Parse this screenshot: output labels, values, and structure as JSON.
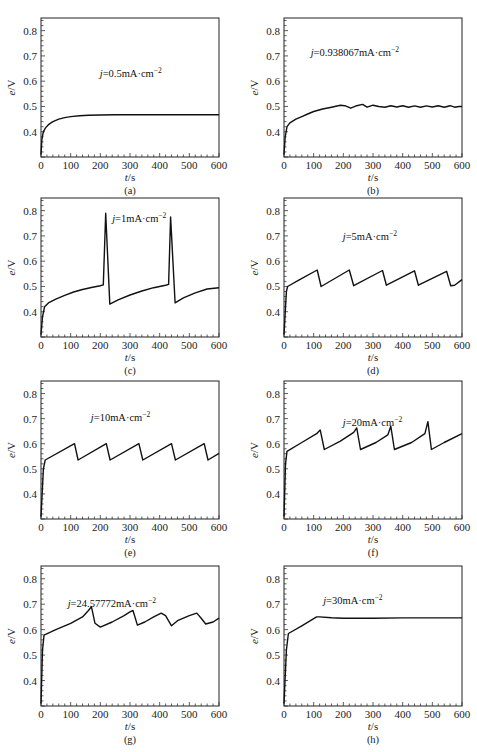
{
  "figure": {
    "panels": [
      {
        "id": "a",
        "caption": "(a)",
        "annotation_prefix": "j",
        "annotation_text": "=0.5mA·cm",
        "annotation_sup": "−2",
        "ann_pos": [
          0.33,
          0.35
        ]
      },
      {
        "id": "b",
        "caption": "(b)",
        "annotation_prefix": "j",
        "annotation_text": "=0.938067mA·cm",
        "annotation_sup": "−2",
        "ann_pos": [
          0.15,
          0.2
        ]
      },
      {
        "id": "c",
        "caption": "(c)",
        "annotation_prefix": "j",
        "annotation_text": "=1mA·cm",
        "annotation_sup": "−2",
        "ann_pos": [
          0.4,
          0.1
        ]
      },
      {
        "id": "d",
        "caption": "(d)",
        "annotation_prefix": "j",
        "annotation_text": "=5mA·cm",
        "annotation_sup": "−2",
        "ann_pos": [
          0.33,
          0.23
        ]
      },
      {
        "id": "e",
        "caption": "(e)",
        "annotation_prefix": "j",
        "annotation_text": "=10mA·cm",
        "annotation_sup": "−2",
        "ann_pos": [
          0.28,
          0.22
        ]
      },
      {
        "id": "f",
        "caption": "(f)",
        "annotation_prefix": "j",
        "annotation_text": "=20mA·cm",
        "annotation_sup": "−2",
        "ann_pos": [
          0.33,
          0.25
        ]
      },
      {
        "id": "g",
        "caption": "(g)",
        "annotation_prefix": "j",
        "annotation_text": "=24.57772mA·cm",
        "annotation_sup": "−2",
        "ann_pos": [
          0.15,
          0.22
        ]
      },
      {
        "id": "h",
        "caption": "(h)",
        "annotation_prefix": "j",
        "annotation_text": "=30mA·cm",
        "annotation_sup": "−2",
        "ann_pos": [
          0.22,
          0.2
        ]
      }
    ],
    "xlabel_italic": "t",
    "xlabel_unit": "/s",
    "ylabel_italic": "e",
    "ylabel_unit": "/V"
  },
  "chart_data": [
    {
      "type": "line",
      "panel": "a",
      "title": "j=0.5mA·cm−2",
      "xlabel": "t/s",
      "ylabel": "e/V",
      "xlim": [
        0,
        600
      ],
      "ylim": [
        0.3,
        0.85
      ],
      "xticks": [
        0,
        100,
        200,
        300,
        400,
        500,
        600
      ],
      "yticks": [
        0.4,
        0.5,
        0.6,
        0.7,
        0.8
      ],
      "x": [
        0,
        3,
        8,
        15,
        25,
        40,
        60,
        80,
        100,
        130,
        160,
        200,
        250,
        300,
        400,
        500,
        600
      ],
      "y": [
        0.31,
        0.37,
        0.4,
        0.415,
        0.428,
        0.44,
        0.45,
        0.456,
        0.46,
        0.463,
        0.465,
        0.466,
        0.467,
        0.467,
        0.467,
        0.467,
        0.467
      ]
    },
    {
      "type": "line",
      "panel": "b",
      "title": "j=0.938067mA·cm−2",
      "xlabel": "t/s",
      "ylabel": "e/V",
      "xlim": [
        0,
        600
      ],
      "ylim": [
        0.3,
        0.85
      ],
      "xticks": [
        0,
        100,
        200,
        300,
        400,
        500,
        600
      ],
      "yticks": [
        0.4,
        0.5,
        0.6,
        0.7,
        0.8
      ],
      "x": [
        0,
        4,
        10,
        20,
        40,
        60,
        80,
        100,
        130,
        160,
        190,
        205,
        225,
        245,
        265,
        280,
        300,
        320,
        340,
        360,
        380,
        400,
        420,
        440,
        460,
        480,
        500,
        520,
        540,
        560,
        575,
        590,
        600
      ],
      "y": [
        0.31,
        0.38,
        0.42,
        0.435,
        0.45,
        0.46,
        0.47,
        0.48,
        0.49,
        0.497,
        0.505,
        0.503,
        0.493,
        0.503,
        0.508,
        0.497,
        0.505,
        0.5,
        0.497,
        0.503,
        0.498,
        0.503,
        0.497,
        0.502,
        0.497,
        0.502,
        0.498,
        0.503,
        0.497,
        0.503,
        0.497,
        0.5,
        0.5
      ]
    },
    {
      "type": "line",
      "panel": "c",
      "title": "j=1mA·cm−2",
      "xlabel": "t/s",
      "ylabel": "e/V",
      "xlim": [
        0,
        600
      ],
      "ylim": [
        0.3,
        0.85
      ],
      "xticks": [
        0,
        100,
        200,
        300,
        400,
        500,
        600
      ],
      "yticks": [
        0.4,
        0.5,
        0.6,
        0.7,
        0.8
      ],
      "x": [
        0,
        5,
        12,
        25,
        50,
        80,
        110,
        140,
        170,
        200,
        210,
        218,
        232,
        260,
        300,
        340,
        380,
        420,
        430,
        437,
        452,
        480,
        520,
        560,
        600
      ],
      "y": [
        0.31,
        0.38,
        0.42,
        0.435,
        0.45,
        0.465,
        0.478,
        0.488,
        0.496,
        0.503,
        0.506,
        0.79,
        0.43,
        0.447,
        0.466,
        0.482,
        0.495,
        0.505,
        0.508,
        0.775,
        0.435,
        0.455,
        0.475,
        0.49,
        0.495
      ]
    },
    {
      "type": "line",
      "panel": "d",
      "title": "j=5mA·cm−2",
      "xlabel": "t/s",
      "ylabel": "e/V",
      "xlim": [
        0,
        600
      ],
      "ylim": [
        0.3,
        0.85
      ],
      "xticks": [
        0,
        100,
        200,
        300,
        400,
        500,
        600
      ],
      "yticks": [
        0.4,
        0.5,
        0.6,
        0.7,
        0.8
      ],
      "x": [
        0,
        8,
        12,
        50,
        112,
        125,
        220,
        235,
        332,
        345,
        440,
        453,
        548,
        562,
        575,
        600
      ],
      "y": [
        0.31,
        0.48,
        0.5,
        0.525,
        0.565,
        0.5,
        0.565,
        0.503,
        0.563,
        0.505,
        0.562,
        0.505,
        0.56,
        0.503,
        0.505,
        0.527
      ]
    },
    {
      "type": "line",
      "panel": "e",
      "title": "j=10mA·cm−2",
      "xlabel": "t/s",
      "ylabel": "e/V",
      "xlim": [
        0,
        600
      ],
      "ylim": [
        0.3,
        0.85
      ],
      "xticks": [
        0,
        100,
        200,
        300,
        400,
        500,
        600
      ],
      "yticks": [
        0.4,
        0.5,
        0.6,
        0.7,
        0.8
      ],
      "x": [
        0,
        8,
        14,
        113,
        125,
        220,
        233,
        330,
        343,
        440,
        453,
        550,
        563,
        600
      ],
      "y": [
        0.31,
        0.5,
        0.535,
        0.6,
        0.535,
        0.6,
        0.535,
        0.6,
        0.535,
        0.6,
        0.535,
        0.6,
        0.535,
        0.562
      ]
    },
    {
      "type": "line",
      "panel": "f",
      "title": "j=20mA·cm−2",
      "xlabel": "t/s",
      "ylabel": "e/V",
      "xlim": [
        0,
        600
      ],
      "ylim": [
        0.3,
        0.85
      ],
      "xticks": [
        0,
        100,
        200,
        300,
        400,
        500,
        600
      ],
      "yticks": [
        0.4,
        0.5,
        0.6,
        0.7,
        0.8
      ],
      "x": [
        0,
        5,
        10,
        60,
        110,
        122,
        136,
        190,
        235,
        245,
        258,
        310,
        350,
        360,
        372,
        430,
        475,
        485,
        497,
        540,
        600
      ],
      "y": [
        0.31,
        0.52,
        0.57,
        0.605,
        0.64,
        0.655,
        0.577,
        0.61,
        0.645,
        0.663,
        0.577,
        0.605,
        0.635,
        0.67,
        0.577,
        0.605,
        0.64,
        0.688,
        0.577,
        0.605,
        0.64
      ]
    },
    {
      "type": "line",
      "panel": "g",
      "title": "j=24.57772mA·cm−2",
      "xlabel": "t/s",
      "ylabel": "e/V",
      "xlim": [
        0,
        600
      ],
      "ylim": [
        0.3,
        0.85
      ],
      "xticks": [
        0,
        100,
        200,
        300,
        400,
        500,
        600
      ],
      "yticks": [
        0.4,
        0.5,
        0.6,
        0.7,
        0.8
      ],
      "x": [
        0,
        5,
        10,
        50,
        100,
        140,
        160,
        170,
        182,
        200,
        240,
        280,
        300,
        310,
        325,
        350,
        380,
        405,
        420,
        440,
        460,
        500,
        525,
        540,
        555,
        580,
        600
      ],
      "y": [
        0.31,
        0.52,
        0.578,
        0.6,
        0.625,
        0.65,
        0.675,
        0.69,
        0.625,
        0.61,
        0.63,
        0.655,
        0.67,
        0.675,
        0.618,
        0.63,
        0.65,
        0.665,
        0.655,
        0.615,
        0.635,
        0.655,
        0.665,
        0.645,
        0.622,
        0.63,
        0.645
      ]
    },
    {
      "type": "line",
      "panel": "h",
      "title": "j=30mA·cm−2",
      "xlabel": "t/s",
      "ylabel": "e/V",
      "xlim": [
        0,
        600
      ],
      "ylim": [
        0.3,
        0.85
      ],
      "xticks": [
        0,
        100,
        200,
        300,
        400,
        500,
        600
      ],
      "yticks": [
        0.4,
        0.5,
        0.6,
        0.7,
        0.8
      ],
      "x": [
        0,
        8,
        15,
        60,
        110,
        120,
        160,
        200,
        300,
        400,
        500,
        600
      ],
      "y": [
        0.31,
        0.52,
        0.585,
        0.615,
        0.65,
        0.65,
        0.647,
        0.645,
        0.645,
        0.646,
        0.646,
        0.646
      ]
    }
  ]
}
